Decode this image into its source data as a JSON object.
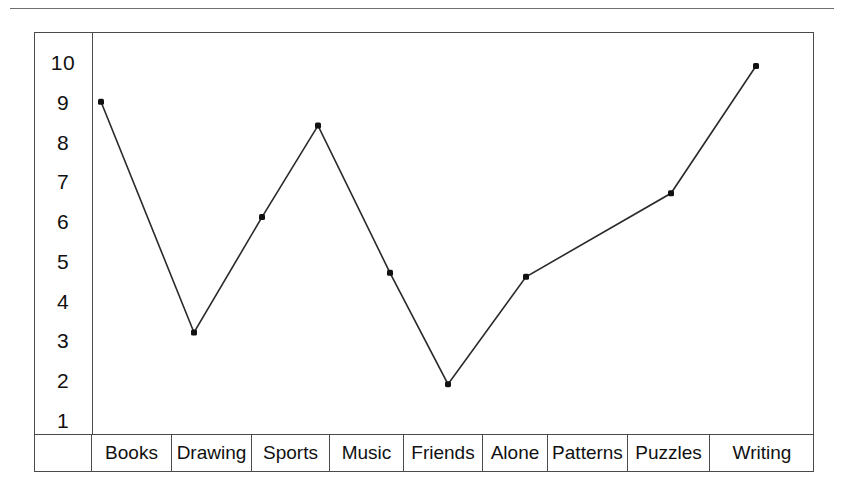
{
  "chart_data": {
    "type": "line",
    "title": "",
    "subtitle": "",
    "xlabel": "",
    "ylabel": "",
    "categories": [
      "Books",
      "Drawing",
      "Sports",
      "Music",
      "Friends",
      "Alone",
      "Patterns",
      "Puzzles",
      "Writing"
    ],
    "y_ticks": [
      "10",
      "9",
      "8",
      "7",
      "6",
      "5",
      "4",
      "3",
      "2",
      "1"
    ],
    "ylim": [
      1,
      10
    ],
    "grid": false,
    "legend": null,
    "marker": "filled-square-dot",
    "line_color": "#2a2a2a",
    "marker_color": "#111111",
    "frame_color": "#4a4a4a",
    "points": [
      {
        "label": "Books",
        "x_px": 101,
        "value": 9.0
      },
      {
        "label": "Drawing",
        "x_px": 194,
        "value": 3.2
      },
      {
        "label": "Sports",
        "x_px": 262,
        "value": 6.1
      },
      {
        "label": "Music",
        "x_px": 318,
        "value": 8.4
      },
      {
        "label": "Friends",
        "x_px": 390,
        "value": 4.7
      },
      {
        "label": "Friends",
        "x_px": 448,
        "value": 1.9
      },
      {
        "label": "Alone",
        "x_px": 526,
        "value": 4.6
      },
      {
        "label": "Patterns",
        "x_px": 671,
        "value": 6.7
      },
      {
        "label": "Writing",
        "x_px": 756,
        "value": 9.9
      }
    ],
    "values": [
      9.0,
      3.2,
      6.1,
      8.4,
      4.7,
      1.9,
      4.6,
      6.7,
      9.9
    ]
  },
  "axis": {
    "y_labels": [
      "10",
      "9",
      "8",
      "7",
      "6",
      "5",
      "4",
      "3",
      "2",
      "1"
    ]
  },
  "categories": {
    "gutter": "",
    "items": [
      {
        "label": "Books"
      },
      {
        "label": "Drawing"
      },
      {
        "label": "Sports"
      },
      {
        "label": "Music"
      },
      {
        "label": "Friends"
      },
      {
        "label": "Alone"
      },
      {
        "label": "Patterns"
      },
      {
        "label": "Puzzles"
      },
      {
        "label": "Writing"
      }
    ]
  }
}
